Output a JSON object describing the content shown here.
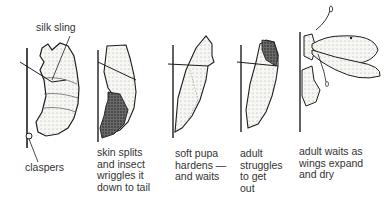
{
  "diagram": {
    "type": "metamorphosis-stages",
    "stages": [
      {
        "id": "stage-1",
        "caption": "",
        "labels": [
          "silk sling",
          "claspers"
        ]
      },
      {
        "id": "stage-2",
        "caption": "skin splits\nand insect\nwriggles it\ndown to tail"
      },
      {
        "id": "stage-3",
        "caption": "soft pupa\nhardens —\nand waits"
      },
      {
        "id": "stage-4",
        "caption": "adult\nstruggles\nto get\nout"
      },
      {
        "id": "stage-5",
        "caption": "adult waits as\nwings expand\nand dry"
      }
    ],
    "callouts": {
      "silk_sling": "silk sling",
      "claspers": "claspers"
    }
  },
  "colors": {
    "ink": "#1e1e1e",
    "text": "#333333",
    "fill": "#f4f4f2",
    "shade": "#8a8a8a"
  }
}
